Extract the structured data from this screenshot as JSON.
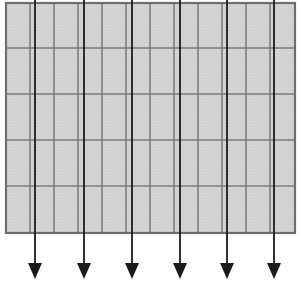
{
  "figure": {
    "background_color": "#ffffff",
    "width": 299,
    "height": 288
  },
  "grid": {
    "name": "grid-panel",
    "x": 6,
    "y": 3,
    "width": 289,
    "height": 230,
    "columns": 12,
    "rows": 5,
    "fill_color": "#d2d2d2",
    "line_color": "#7d7d7d",
    "border_color": "#6e6e6e",
    "line_width": 1.6,
    "border_width": 2.2,
    "column_edges": [
      6,
      30,
      54,
      78,
      102,
      126,
      150,
      174,
      198,
      222,
      246,
      270,
      295
    ],
    "row_edges": [
      3,
      48,
      94,
      140,
      186,
      233
    ]
  },
  "arrows": {
    "name": "downward-arrow-set",
    "count": 6,
    "color": "#1a1a1a",
    "shaft_width": 1.8,
    "top_y": 0,
    "tip_y": 279,
    "head_length": 16,
    "head_half_width": 7,
    "x_positions": [
      35,
      84,
      132,
      180,
      227,
      274
    ],
    "labels": [
      "arrow-1",
      "arrow-2",
      "arrow-3",
      "arrow-4",
      "arrow-5",
      "arrow-6"
    ]
  }
}
